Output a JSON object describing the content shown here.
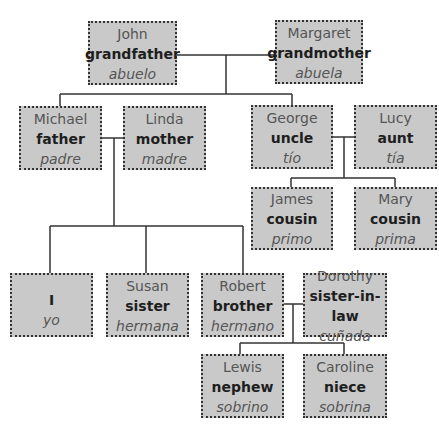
{
  "diagram": {
    "type": "family-tree",
    "line_color": "#333333",
    "box_fill": "#c9c9c9",
    "box_border": "#333333",
    "people": [
      {
        "id": "john",
        "name": "John",
        "relation": "grandfather",
        "spanish": "abuelo"
      },
      {
        "id": "margaret",
        "name": "Margaret",
        "relation": "grandmother",
        "spanish": "abuela"
      },
      {
        "id": "michael",
        "name": "Michael",
        "relation": "father",
        "spanish": "padre"
      },
      {
        "id": "linda",
        "name": "Linda",
        "relation": "mother",
        "spanish": "madre"
      },
      {
        "id": "george",
        "name": "George",
        "relation": "uncle",
        "spanish": "tío"
      },
      {
        "id": "lucy",
        "name": "Lucy",
        "relation": "aunt",
        "spanish": "tía"
      },
      {
        "id": "james",
        "name": "James",
        "relation": "cousin",
        "spanish": "primo"
      },
      {
        "id": "mary",
        "name": "Mary",
        "relation": "cousin",
        "spanish": "prima"
      },
      {
        "id": "self",
        "name": "",
        "relation": "I",
        "spanish": "yo"
      },
      {
        "id": "susan",
        "name": "Susan",
        "relation": "sister",
        "spanish": "hermana"
      },
      {
        "id": "robert",
        "name": "Robert",
        "relation": "brother",
        "spanish": "hermano"
      },
      {
        "id": "dorothy",
        "name": "Dorothy",
        "relation": "sister-in-law",
        "spanish": "cuñada"
      },
      {
        "id": "lewis",
        "name": "Lewis",
        "relation": "nephew",
        "spanish": "sobrino"
      },
      {
        "id": "caroline",
        "name": "Caroline",
        "relation": "niece",
        "spanish": "sobrina"
      }
    ],
    "couples": [
      [
        "john",
        "margaret"
      ],
      [
        "michael",
        "linda"
      ],
      [
        "george",
        "lucy"
      ],
      [
        "robert",
        "dorothy"
      ]
    ],
    "children": {
      "john+margaret": [
        "michael",
        "george"
      ],
      "michael+linda": [
        "self",
        "susan",
        "robert"
      ],
      "george+lucy": [
        "james",
        "mary"
      ],
      "robert+dorothy": [
        "lewis",
        "caroline"
      ]
    }
  }
}
